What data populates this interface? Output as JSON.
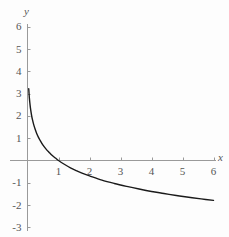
{
  "chart_data": {
    "type": "line",
    "title": "",
    "subtitle": "",
    "xlabel": "x",
    "ylabel": "y",
    "xlim": [
      0,
      6.2
    ],
    "ylim": [
      -3,
      6
    ],
    "xticks": [
      1,
      2,
      3,
      4,
      5,
      6
    ],
    "xtick_labels": [
      "1",
      "2",
      "3",
      "4",
      "5",
      "6"
    ],
    "yticks": [
      6,
      5,
      4,
      3,
      2,
      1,
      -1,
      -2,
      -3
    ],
    "ytick_labels": [
      "6",
      "5",
      "4",
      "3",
      "2",
      "1",
      "-1",
      "-2",
      "-3"
    ],
    "grid": false,
    "legend": null,
    "legend_position": "none",
    "series": [
      {
        "name": "y = -ln(x)",
        "color": "#1a1a1a",
        "line_width": 1.4,
        "x": [
          0.04,
          0.06,
          0.08,
          0.1,
          0.13,
          0.16,
          0.2,
          0.25,
          0.3,
          0.35,
          0.4,
          0.5,
          0.6,
          0.7,
          0.8,
          0.9,
          1.0,
          1.2,
          1.4,
          1.6,
          1.8,
          2.0,
          2.4,
          2.8,
          3.2,
          3.6,
          4.0,
          4.4,
          4.8,
          5.2,
          5.6,
          6.0,
          6.2
        ],
        "y": [
          3.22,
          2.81,
          2.53,
          2.3,
          2.04,
          1.83,
          1.61,
          1.39,
          1.2,
          1.05,
          0.92,
          0.69,
          0.51,
          0.36,
          0.22,
          0.11,
          0.0,
          -0.18,
          -0.34,
          -0.47,
          -0.59,
          -0.69,
          -0.88,
          -1.03,
          -1.16,
          -1.28,
          -1.39,
          -1.48,
          -1.57,
          -1.65,
          -1.72,
          -1.79,
          -1.82
        ]
      }
    ],
    "axis_color": "#9a9a9a",
    "curve_color": "#1a1a1a",
    "background_color": "#fdfdfd"
  },
  "axes": {
    "y_name": "y",
    "x_name": "x"
  }
}
